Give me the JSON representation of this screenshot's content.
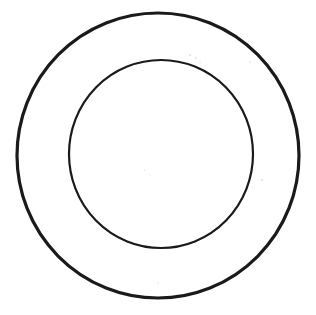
{
  "diagram": {
    "type": "concentric-circles",
    "background": "#ffffff",
    "stroke_color": "#1a1a1a",
    "shapes": [
      {
        "name": "outer-circle",
        "cx": 158,
        "cy": 155.5,
        "rx": 141,
        "ry": 142.5,
        "stroke_width": 3.2
      },
      {
        "name": "inner-circle",
        "cx": 161,
        "cy": 154,
        "rx": 92,
        "ry": 94,
        "stroke_width": 2.2
      }
    ]
  }
}
